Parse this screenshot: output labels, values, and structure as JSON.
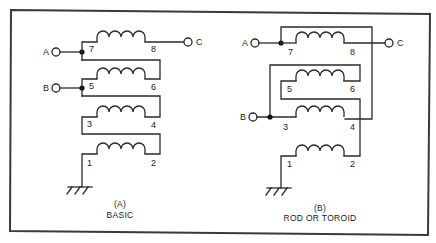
{
  "figure": {
    "panels": [
      {
        "id": "A",
        "caption_letter": "(A)",
        "caption_title": "BASIC",
        "terminals": [
          "A",
          "B",
          "C"
        ],
        "windings": [
          {
            "start": "7",
            "end": "8"
          },
          {
            "start": "5",
            "end": "6"
          },
          {
            "start": "3",
            "end": "4"
          },
          {
            "start": "1",
            "end": "2"
          }
        ],
        "ground": "ground-symbol"
      },
      {
        "id": "B",
        "caption_letter": "(B)",
        "caption_title": "ROD OR TOROID",
        "terminals": [
          "A",
          "B",
          "C"
        ],
        "windings": [
          {
            "start": "7",
            "end": "8"
          },
          {
            "start": "5",
            "end": "6"
          },
          {
            "start": "3",
            "end": "4"
          },
          {
            "start": "1",
            "end": "2"
          }
        ],
        "ground": "ground-symbol"
      }
    ]
  },
  "colors": {
    "line": "#2a2a2a",
    "background": "#ffffff"
  }
}
